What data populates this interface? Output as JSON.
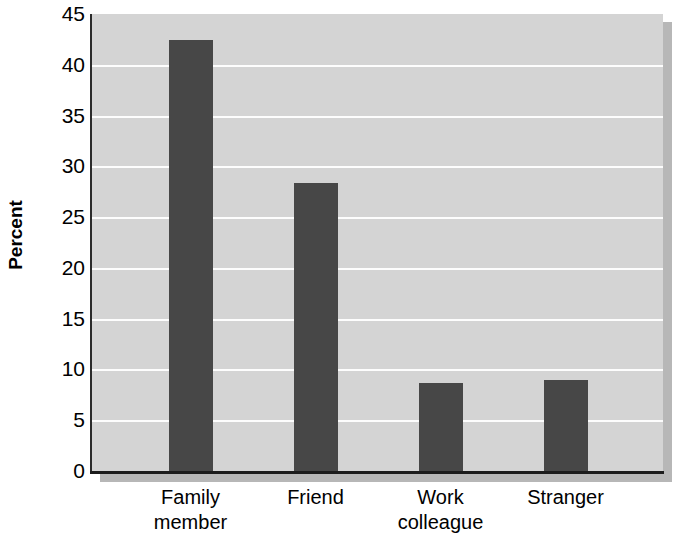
{
  "chart_data": {
    "type": "bar",
    "title": "",
    "subtitle": "",
    "xlabel": "",
    "ylabel": "Percent",
    "categories": [
      "Family member",
      "Friend",
      "Work colleague",
      "Stranger"
    ],
    "category_lines": [
      [
        "Family",
        "member"
      ],
      [
        "Friend"
      ],
      [
        "Work",
        "colleague"
      ],
      [
        "Stranger"
      ]
    ],
    "values": [
      42.4,
      28.4,
      8.7,
      9.0
    ],
    "ylim": [
      0,
      45
    ],
    "ytick_step": 5,
    "yticks": [
      45,
      40,
      35,
      30,
      25,
      20,
      15,
      10,
      5,
      0
    ],
    "ytick_labels": [
      "45",
      "40",
      "35",
      "30",
      "25",
      "20",
      "15",
      "10",
      "5",
      "0"
    ],
    "grid": true,
    "grid_axis": "y",
    "legend": false,
    "legend_position": "none",
    "bar_color": "#474747",
    "plot_background": "#d4d4d4",
    "gridline_color": "#fdfdfd",
    "axis_color": "#1c1c1c"
  }
}
